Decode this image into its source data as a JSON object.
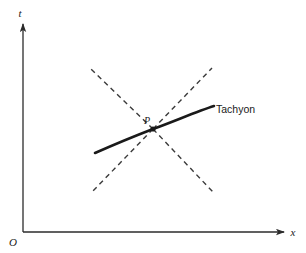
{
  "figure": {
    "kind": "spacetime-diagram",
    "background_color": "#ffffff",
    "ink_color": "#2b2b2b",
    "curve_color": "#1a1a1a"
  },
  "axes": {
    "origin_label": "O",
    "x_axis_label": "x",
    "y_axis_label": "t",
    "x_axis": {
      "x1": 23,
      "y1": 232,
      "x2": 286,
      "y2": 232
    },
    "y_axis": {
      "x1": 23,
      "y1": 232,
      "x2": 23,
      "y2": 22
    },
    "origin_label_pos": {
      "x": 13,
      "y": 246
    },
    "x_label_pos": {
      "x": 293,
      "y": 236
    },
    "y_label_pos": {
      "x": 20,
      "y": 17
    }
  },
  "lightcone": {
    "label": "light-cone",
    "style": "dashed",
    "dash_pattern": "5,4",
    "color": "#3a3a3a",
    "width": 1.4,
    "lines": [
      {
        "name": "upper-right-ray",
        "x1": 153,
        "y1": 129,
        "x2": 212,
        "y2": 68
      },
      {
        "name": "lower-left-ray",
        "x1": 153,
        "y1": 129,
        "x2": 92,
        "y2": 192
      },
      {
        "name": "upper-left-ray",
        "x1": 153,
        "y1": 129,
        "x2": 90,
        "y2": 68
      },
      {
        "name": "lower-right-ray",
        "x1": 153,
        "y1": 129,
        "x2": 213,
        "y2": 192
      }
    ]
  },
  "worldline": {
    "label": "Tachyon",
    "label_pos": {
      "x": 216,
      "y": 113
    },
    "color": "#1a1a1a",
    "width": 2.6,
    "path": "M 95,153 C 120,142 140,134 153,129 C 175,121 198,111 214,106",
    "leader": {
      "x1": 206,
      "y1": 109,
      "x2": 215,
      "y2": 107
    }
  },
  "event": {
    "label": "P",
    "label_pos": {
      "x": 147,
      "y": 124
    },
    "marker_pos": {
      "x": 153,
      "y": 129
    },
    "marker_radius": 2.6
  }
}
